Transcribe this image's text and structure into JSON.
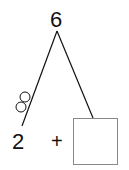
{
  "diagram": {
    "type": "number-bond",
    "whole": "6",
    "part_left": "2",
    "operator": "+",
    "part_right": "",
    "counters_on_left_branch": 2,
    "colors": {
      "text": "#111111",
      "line": "#111111",
      "box_border": "#888888"
    }
  }
}
